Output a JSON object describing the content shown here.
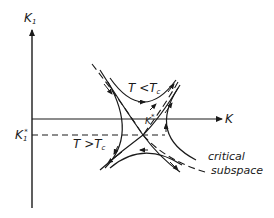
{
  "diagram": {
    "type": "renormalization-group-flow",
    "axes": {
      "vertical": {
        "label": "K",
        "subscript": "1"
      },
      "horizontal": {
        "label": "K"
      }
    },
    "fixed_point": {
      "label": "K",
      "superscript": "*"
    },
    "critical_value": {
      "label": "K",
      "subscript": "1",
      "superscript": "*"
    },
    "regions": {
      "below_tc": {
        "text": "T",
        "op": "<",
        "tc": "T",
        "tc_sub": "c"
      },
      "above_tc": {
        "text": "T",
        "op": ">",
        "tc": "T",
        "tc_sub": "c"
      }
    },
    "annotation": {
      "line1": "critical",
      "line2": "subspace"
    },
    "colors": {
      "ink": "#1a1a1a",
      "background": "#ffffff"
    }
  }
}
